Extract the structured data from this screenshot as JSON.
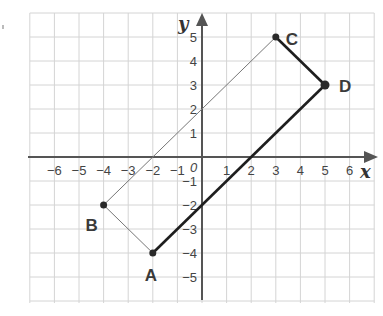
{
  "figure": {
    "grid": {
      "x_min": -7,
      "x_max": 7,
      "y_min": -6,
      "y_max": 6,
      "step": 1,
      "line_color": "#d4d4d4"
    },
    "axes": {
      "x_label": "x",
      "y_label": "y",
      "origin_label": "0",
      "x_ticks": [
        "-6",
        "-5",
        "-4",
        "-3",
        "-2",
        "-1",
        "1",
        "2",
        "3",
        "4",
        "5",
        "6"
      ],
      "y_ticks": [
        "5",
        "4",
        "3",
        "2",
        "1",
        "-1",
        "-2",
        "-3",
        "-4",
        "-5"
      ],
      "color": "#555555"
    },
    "points": [
      {
        "label": "A",
        "x": -2,
        "y": -4
      },
      {
        "label": "B",
        "x": -4,
        "y": -2
      },
      {
        "label": "C",
        "x": 3,
        "y": 5
      },
      {
        "label": "D",
        "x": 5,
        "y": 3
      }
    ],
    "segments": [
      {
        "from": "A",
        "to": "B",
        "style": "thin"
      },
      {
        "from": "B",
        "to": "C",
        "style": "thin"
      },
      {
        "from": "C",
        "to": "D",
        "style": "thick"
      },
      {
        "from": "D",
        "to": "A",
        "style": "thick"
      }
    ]
  }
}
